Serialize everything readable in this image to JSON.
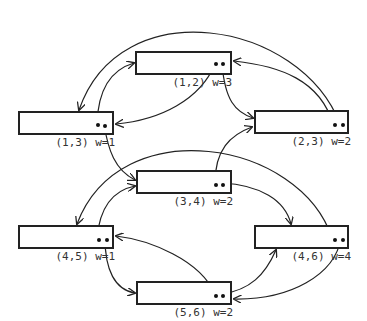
{
  "diagram": {
    "type": "linked-list graph of weighted edges",
    "nodes": [
      {
        "id": "n12",
        "label": "(1,2) w=3",
        "x": 135,
        "y": 51,
        "w": 97,
        "h": 24
      },
      {
        "id": "n13",
        "label": "(1,3) w=1",
        "x": 18,
        "y": 111,
        "w": 96,
        "h": 24
      },
      {
        "id": "n23",
        "label": "(2,3) w=2",
        "x": 254,
        "y": 110,
        "w": 95,
        "h": 24
      },
      {
        "id": "n34",
        "label": "(3,4) w=2",
        "x": 136,
        "y": 170,
        "w": 96,
        "h": 24
      },
      {
        "id": "n45",
        "label": "(4,5) w=1",
        "x": 18,
        "y": 225,
        "w": 96,
        "h": 24
      },
      {
        "id": "n46",
        "label": "(4,6) w=4",
        "x": 254,
        "y": 225,
        "w": 95,
        "h": 24
      },
      {
        "id": "n56",
        "label": "(5,6) w=2",
        "x": 136,
        "y": 281,
        "w": 96,
        "h": 24
      }
    ],
    "edges": [
      {
        "from": "n12",
        "to": "n13"
      },
      {
        "from": "n12",
        "to": "n23"
      },
      {
        "from": "n13",
        "to": "n12"
      },
      {
        "from": "n13",
        "to": "n34"
      },
      {
        "from": "n23",
        "to": "n12"
      },
      {
        "from": "n23",
        "to": "n13"
      },
      {
        "from": "n34",
        "to": "n23"
      },
      {
        "from": "n34",
        "to": "n46"
      },
      {
        "from": "n45",
        "to": "n34"
      },
      {
        "from": "n45",
        "to": "n56"
      },
      {
        "from": "n46",
        "to": "n45"
      },
      {
        "from": "n46",
        "to": "n56"
      },
      {
        "from": "n56",
        "to": "n45"
      },
      {
        "from": "n56",
        "to": "n46"
      }
    ]
  }
}
